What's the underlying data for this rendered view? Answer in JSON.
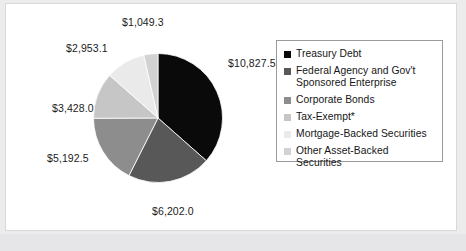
{
  "chart_data": {
    "type": "pie",
    "title": "",
    "subtitle": "",
    "xlabel": "",
    "ylabel": "",
    "legend_position": "right",
    "grid": false,
    "start_angle_deg": 0,
    "direction": "clockwise",
    "total": 29652.4,
    "categories": [
      "Treasury Debt",
      "Federal Agency and Gov't Sponsored Enterprise",
      "Corporate Bonds",
      "Tax-Exempt*",
      "Mortgage-Backed Securities",
      "Other Asset-Backed Securities"
    ],
    "values": [
      10827.5,
      6202.0,
      5192.5,
      3428.0,
      2953.1,
      1049.3
    ],
    "data_labels": [
      "$10,827.5",
      "$6,202.0",
      "$5,192.5",
      "$3,428.0",
      "$2,953.1",
      "$1,049.3"
    ],
    "colors": [
      "#0a0a0a",
      "#585858",
      "#8d8d8d",
      "#c6c6c6",
      "#eaeaea",
      "#d2d2d2"
    ]
  },
  "legend": {
    "items": [
      {
        "label": "Treasury Debt",
        "color": "#0a0a0a"
      },
      {
        "label": "Federal Agency and Gov't Sponsored Enterprise",
        "color": "#585858"
      },
      {
        "label": "Corporate Bonds",
        "color": "#8d8d8d"
      },
      {
        "label": "Tax-Exempt*",
        "color": "#c6c6c6"
      },
      {
        "label": "Mortgage-Backed Securities",
        "color": "#eaeaea"
      },
      {
        "label": "Other Asset-Backed Securities",
        "color": "#d2d2d2"
      }
    ]
  },
  "colors": {
    "page_background": "#ececed",
    "panel_background": "#ffffff",
    "panel_border": "#d9d9db",
    "legend_border": "#9a9a9c",
    "label_text": "#1b1b1b",
    "slice_outline": "#ffffff"
  }
}
